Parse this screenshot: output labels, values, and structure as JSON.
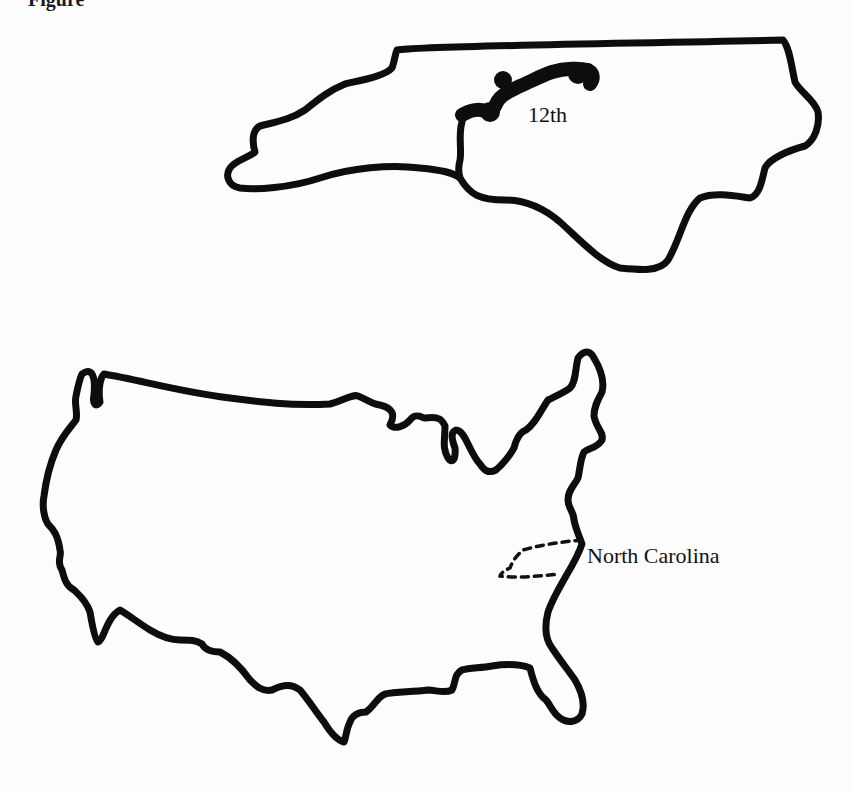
{
  "figure": {
    "heading_partial": "Figure",
    "nc_map": {
      "name": "North Carolina",
      "highlighted_district": "12th",
      "label": "12th"
    },
    "us_map": {
      "name": "United States",
      "highlighted_state": "North Carolina",
      "label": "North Carolina"
    },
    "colors": {
      "outline": "#0d0d0d",
      "background": "#fdfdfd"
    }
  }
}
